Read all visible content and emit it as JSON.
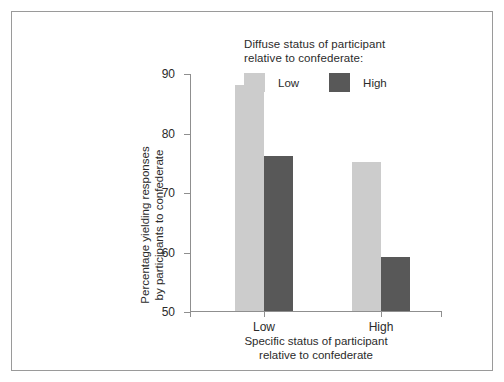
{
  "chart_data": {
    "type": "bar",
    "title": "",
    "categories": [
      "Low",
      "High"
    ],
    "series": [
      {
        "name": "Low",
        "values": [
          88,
          75
        ],
        "color": "#cccccc"
      },
      {
        "name": "High",
        "values": [
          76,
          59
        ],
        "color": "#585858"
      }
    ],
    "xlabel": "Specific status of participant\nrelative to confederate",
    "ylabel": "Percentage yielding responses\nby participants to confederate",
    "ylim": [
      50,
      90
    ],
    "yticks": [
      50,
      60,
      70,
      80,
      90
    ],
    "ytick_labels": [
      "50",
      "60",
      "70",
      "80",
      "90"
    ],
    "grid": false,
    "legend_position": "top-right",
    "legend_title": "Diffuse status of participant\nrelative to confederate:"
  },
  "legend": {
    "title": "Diffuse status of participant\nrelative to confederate:",
    "entries": [
      {
        "label": "Low",
        "color": "#cccccc"
      },
      {
        "label": "High",
        "color": "#585858"
      }
    ]
  },
  "axes": {
    "y_title": "Percentage yielding responses\nby participants to confederate",
    "x_title": "Specific status of participant\nrelative to confederate",
    "y_ticks": [
      "50",
      "60",
      "70",
      "80",
      "90"
    ],
    "x_groups": [
      "Low",
      "High"
    ]
  },
  "colors": {
    "bar_low": "#cccccc",
    "bar_high": "#585858",
    "axis": "#8f8f8f",
    "frame": "#9a9a9a",
    "text": "#2b2b2b",
    "background": "#ffffff"
  }
}
